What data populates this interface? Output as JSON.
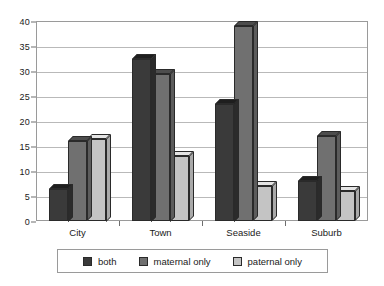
{
  "chart_data": {
    "type": "bar",
    "title": "",
    "subtitle": "",
    "xlabel": "",
    "ylabel": "",
    "categories": [
      "City",
      "Town",
      "Seaside",
      "Suburb"
    ],
    "series": [
      {
        "name": "both",
        "color": "#3a3a3a",
        "values": [
          6.5,
          32.5,
          23.5,
          8
        ]
      },
      {
        "name": "maternal only",
        "color": "#707070",
        "values": [
          16,
          29.5,
          39,
          17
        ]
      },
      {
        "name": "paternal only",
        "color": "#c4c4c4",
        "values": [
          16.5,
          13,
          7,
          6
        ]
      }
    ],
    "ylim": [
      0,
      40
    ],
    "ytick_step": 5,
    "yticks": [
      "40",
      "35",
      "30",
      "25",
      "20",
      "15",
      "10",
      "5",
      "0"
    ],
    "grid": true,
    "legend_position": "bottom"
  },
  "legend": {
    "items": [
      {
        "label": "both"
      },
      {
        "label": "maternal only"
      },
      {
        "label": "paternal only"
      }
    ]
  }
}
